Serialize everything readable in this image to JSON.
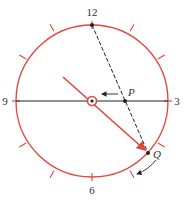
{
  "diagram": {
    "type": "clock-projection",
    "colors": {
      "circle": "#e0463a",
      "hand": "#e0463a",
      "line": "#222222",
      "text": "#333333"
    },
    "labels": {
      "twelve": "12",
      "three": "3",
      "six": "6",
      "nine": "9",
      "point_p": "P",
      "point_q": "Q"
    }
  }
}
